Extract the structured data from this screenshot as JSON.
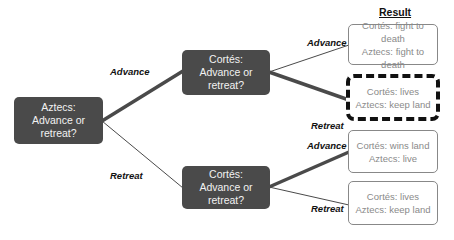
{
  "header": {
    "title": "Result"
  },
  "root": {
    "line1": "Aztecs:",
    "line2": "Advance or",
    "line3": "retreat?"
  },
  "cortes_top": {
    "line1": "Cortés:",
    "line2": "Advance or",
    "line3": "retreat?"
  },
  "cortes_bottom": {
    "line1": "Cortés:",
    "line2": "Advance or",
    "line3": "retreat?"
  },
  "edge_labels": {
    "root_advance": "Advance",
    "root_retreat": "Retreat",
    "top_advance": "Advance",
    "top_retreat": "Retreat",
    "bottom_advance": "Advance",
    "bottom_retreat": "Retreat"
  },
  "results": [
    {
      "cortes": "Cortés: fight to death",
      "aztecs": "Aztecs: fight to death",
      "highlighted": false
    },
    {
      "cortes": "Cortés: lives",
      "aztecs": "Aztecs: keep land",
      "highlighted": true
    },
    {
      "cortes": "Cortés: wins land",
      "aztecs": "Aztecs: live",
      "highlighted": false
    },
    {
      "cortes": "Cortés: lives",
      "aztecs": "Aztecs: keep land",
      "highlighted": false
    }
  ],
  "colors": {
    "node": "#4a4a4a",
    "edge": "#4a4a4a",
    "result_text": "#8a8a8a",
    "highlight_border": "#111111"
  }
}
